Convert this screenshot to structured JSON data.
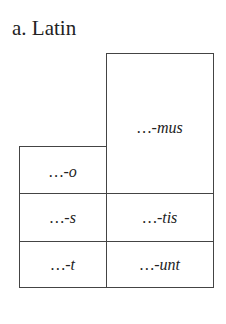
{
  "title": "a. Latin",
  "paradigm": {
    "language": "Latin",
    "columns": [
      "singular",
      "plural"
    ],
    "rows": [
      {
        "person": "1",
        "singular": "…-o",
        "plural": "…-mus"
      },
      {
        "person": "2",
        "singular": "…-s",
        "plural": "…-tis"
      },
      {
        "person": "3",
        "singular": "…-t",
        "plural": "…-unt"
      }
    ]
  },
  "cells": {
    "sg1": "…-o",
    "sg2": "…-s",
    "sg3": "…-t",
    "pl1": "…-mus",
    "pl2": "…-tis",
    "pl3": "…-unt"
  }
}
